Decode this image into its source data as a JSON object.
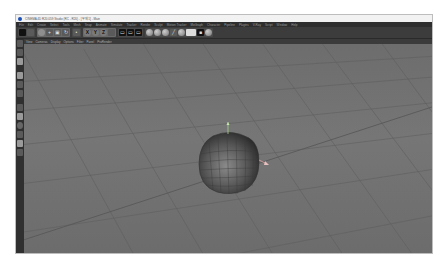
{
  "window": {
    "title": "CINEMA 4D R20.059 Studio (RC - R20) - [무제 1] - Main"
  },
  "menubar": {
    "items": [
      "File",
      "Edit",
      "Create",
      "Select",
      "Tools",
      "Mesh",
      "Snap",
      "Animate",
      "Simulate",
      "Tracker",
      "Render",
      "Sculpt",
      "Motion Tracker",
      "MoGraph",
      "Character",
      "Pipeline",
      "Plugins",
      "V-Ray",
      "Script",
      "Window",
      "Help"
    ]
  },
  "toolbar": {
    "undo_icon": "undo-icon",
    "axis_x": "X",
    "axis_y": "Y",
    "axis_z": "Z"
  },
  "viewport": {
    "menu": [
      "View",
      "Cameras",
      "Display",
      "Options",
      "Filter",
      "Panel",
      "ProRender"
    ],
    "object": "subdivided-cube",
    "colors": {
      "background": "#717171",
      "grid": "#5e5e5e",
      "object": "#6a6a6a"
    }
  }
}
